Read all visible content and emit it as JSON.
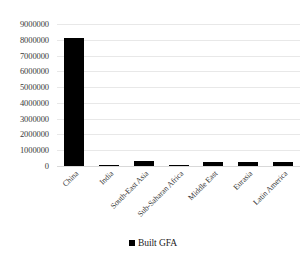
{
  "chart_data": {
    "type": "bar",
    "title": "",
    "xlabel": "",
    "ylabel": "",
    "categories": [
      "China",
      "India",
      "South-East Asia",
      "Sub-Saharan Africa",
      "Middle East",
      "Eurasia",
      "Latin America"
    ],
    "values": [
      8100000,
      60000,
      310000,
      70000,
      250000,
      270000,
      250000
    ],
    "series": [
      {
        "name": "Built GFA",
        "color": "#000000",
        "values": [
          8100000,
          60000,
          310000,
          70000,
          250000,
          270000,
          250000
        ]
      }
    ],
    "ylim": [
      0,
      9000000
    ],
    "ytick_labels": [
      "9000000",
      "8000000",
      "7000000",
      "6000000",
      "5000000",
      "4000000",
      "3000000",
      "2000000",
      "1000000",
      "0"
    ],
    "ytick_values": [
      9000000,
      8000000,
      7000000,
      6000000,
      5000000,
      4000000,
      3000000,
      2000000,
      1000000,
      0
    ],
    "grid": true,
    "grid_color": "#e8e8e8",
    "legend": {
      "position": "bottom",
      "entries": [
        {
          "label": "Built GFA",
          "color": "#000000",
          "marker": "square-marker"
        }
      ]
    }
  }
}
